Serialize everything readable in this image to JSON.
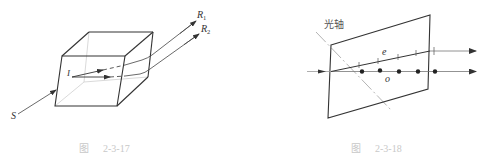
{
  "figures": [
    {
      "id": "left",
      "caption_prefix": "图",
      "caption_number": "2-3-17",
      "labels": {
        "source": "S",
        "incident": "I",
        "ray1": "R",
        "ray1_sub": "1",
        "ray2": "R",
        "ray2_sub": "2"
      },
      "description": "Birefringent crystal block splitting incident ray S into two rays R1 and R2"
    },
    {
      "id": "right",
      "caption_prefix": "图",
      "caption_number": "2-3-18",
      "labels": {
        "optic_axis": "光轴",
        "e_ray": "e",
        "o_ray": "o"
      },
      "description": "Crystal plate with optic axis; extraordinary (e) ray marked with ticks, ordinary (o) ray marked with dots"
    }
  ],
  "colors": {
    "line": "#333333",
    "light_line": "#bbbbbb",
    "caption": "#c8c8c8"
  }
}
